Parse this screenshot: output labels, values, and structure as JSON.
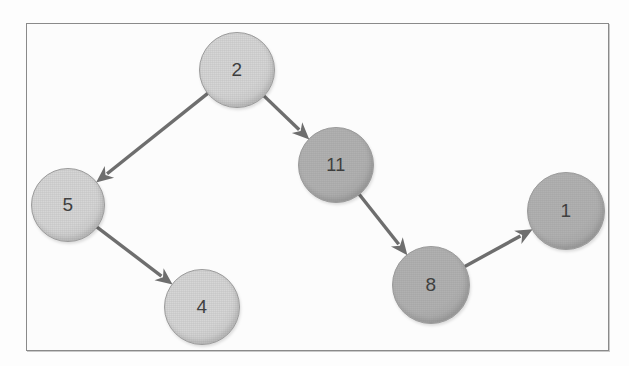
{
  "figure": {
    "background_color": "#fdfdfd",
    "frame_color": "#8a8a8a",
    "canvas_color": "#fcfcfc",
    "node_light_fill": "#d6d6d6",
    "node_dark_fill": "#b1b1b1",
    "node_stroke": "#9b9b9b",
    "edge_color": "#6e6e6e",
    "label_color": "#3b3b3b"
  },
  "graph": {
    "type": "directed-graph",
    "nodes": [
      {
        "id": "n2",
        "label": "2",
        "cx": 237,
        "cy": 70,
        "r": 38,
        "shade": "light",
        "font_size": 19
      },
      {
        "id": "n5",
        "label": "5",
        "cx": 68,
        "cy": 205,
        "r": 37,
        "shade": "light",
        "font_size": 19
      },
      {
        "id": "n11",
        "label": "11",
        "cx": 336,
        "cy": 165,
        "r": 38,
        "shade": "dark",
        "font_size": 18
      },
      {
        "id": "n4",
        "label": "4",
        "cx": 202,
        "cy": 307,
        "r": 38,
        "shade": "light",
        "font_size": 19
      },
      {
        "id": "n8",
        "label": "8",
        "cx": 431,
        "cy": 285,
        "r": 39,
        "shade": "dark",
        "font_size": 19
      },
      {
        "id": "n1",
        "label": "1",
        "cx": 566,
        "cy": 211,
        "r": 39,
        "shade": "dark",
        "font_size": 19
      }
    ],
    "edges": [
      {
        "id": "e-2-5",
        "from": "n2",
        "to": "n5",
        "label": ""
      },
      {
        "id": "e-2-11",
        "from": "n2",
        "to": "n11",
        "label": ""
      },
      {
        "id": "e-5-4",
        "from": "n5",
        "to": "n4",
        "label": ""
      },
      {
        "id": "e-11-8",
        "from": "n11",
        "to": "n8",
        "label": ""
      },
      {
        "id": "e-8-1",
        "from": "n8",
        "to": "n1",
        "label": ""
      }
    ]
  }
}
